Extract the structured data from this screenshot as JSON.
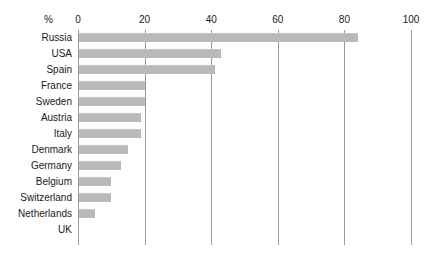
{
  "chart_data": {
    "type": "bar",
    "orientation": "horizontal",
    "title": "",
    "xlabel": "%",
    "ylabel": "",
    "xlim": [
      0,
      100
    ],
    "xticks": [
      0,
      20,
      40,
      60,
      80,
      100
    ],
    "grid": true,
    "legend": null,
    "bar_color": "#b9b9b9",
    "axis_color": "#9a9a9a",
    "text_color": "#1a1a1a",
    "categories": [
      "Russia",
      "USA",
      "Spain",
      "France",
      "Sweden",
      "Austria",
      "Italy",
      "Denmark",
      "Germany",
      "Belgium",
      "Switzerland",
      "Netherlands",
      "UK"
    ],
    "values": [
      84,
      43,
      41,
      20,
      20,
      19,
      19,
      15,
      13,
      10,
      10,
      5,
      0
    ]
  },
  "axis": {
    "unit_label": "%",
    "tick_labels": [
      "0",
      "20",
      "40",
      "60",
      "80",
      "100"
    ]
  }
}
